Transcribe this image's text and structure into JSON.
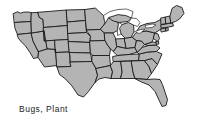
{
  "figure": {
    "kind": "choropleth-outline-map",
    "region": "United States (contiguous 48 states)",
    "caption": "Bugs, Plant",
    "background_color": "#ffffff",
    "state_fill_color": "#b4b4b4",
    "state_border_color": "#1a1a1a",
    "water_fill_color": "#ffffff",
    "caption_color": "#1c1c1c"
  },
  "map": {
    "title": "",
    "water_features": [
      "Lake Superior",
      "Lake Michigan",
      "Lake Huron",
      "Lake Erie",
      "Lake Ontario"
    ],
    "states": [
      "Washington",
      "Oregon",
      "California",
      "Nevada",
      "Idaho",
      "Montana",
      "Wyoming",
      "Utah",
      "Arizona",
      "Colorado",
      "New Mexico",
      "North Dakota",
      "South Dakota",
      "Nebraska",
      "Kansas",
      "Oklahoma",
      "Texas",
      "Minnesota",
      "Iowa",
      "Missouri",
      "Arkansas",
      "Louisiana",
      "Wisconsin",
      "Illinois",
      "Michigan",
      "Indiana",
      "Ohio",
      "Kentucky",
      "Tennessee",
      "Mississippi",
      "Alabama",
      "Georgia",
      "Florida",
      "South Carolina",
      "North Carolina",
      "Virginia",
      "West Virginia",
      "Maryland",
      "Delaware",
      "Pennsylvania",
      "New Jersey",
      "New York",
      "Connecticut",
      "Rhode Island",
      "Massachusetts",
      "Vermont",
      "New Hampshire",
      "Maine"
    ]
  }
}
